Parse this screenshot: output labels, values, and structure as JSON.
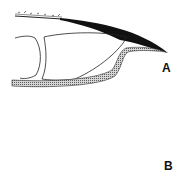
{
  "figure": {
    "panels": [
      {
        "id": "A",
        "label": "A",
        "description": "Sagittal section of fingertip showing nail plate, distal phalanx and nail bed"
      },
      {
        "id": "B",
        "label": "B",
        "description": "Dorsal view of nail showing nail plate with lunula-like distal zone and dark border"
      }
    ]
  },
  "colors": {
    "ink": "#111111",
    "hatch": "#9a9a9a",
    "plate_light": "#b9b9b9",
    "plate_dark": "#6e6e6e",
    "background": "#ffffff"
  }
}
